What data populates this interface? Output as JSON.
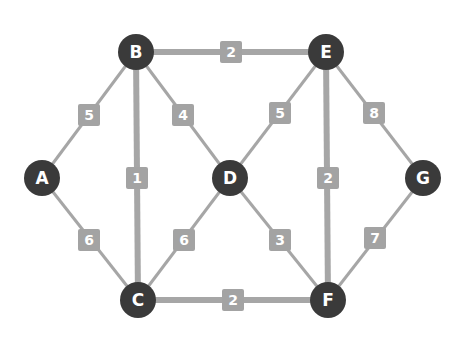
{
  "graph": {
    "colors": {
      "node": "#3a3a3a",
      "edge": "#a6a6a6",
      "label_bg": "#a3a3a3",
      "label_text": "#ffffff"
    },
    "nodes": [
      {
        "id": "A",
        "x": 42,
        "y": 178
      },
      {
        "id": "B",
        "x": 136,
        "y": 52
      },
      {
        "id": "C",
        "x": 138,
        "y": 300
      },
      {
        "id": "D",
        "x": 230,
        "y": 178
      },
      {
        "id": "E",
        "x": 326,
        "y": 52
      },
      {
        "id": "F",
        "x": 328,
        "y": 300
      },
      {
        "id": "G",
        "x": 423,
        "y": 178
      }
    ],
    "edges": [
      {
        "from": "A",
        "to": "B",
        "weight": "5",
        "lx": 89,
        "ly": 115,
        "thick": false
      },
      {
        "from": "A",
        "to": "C",
        "weight": "6",
        "lx": 89,
        "ly": 240,
        "thick": false
      },
      {
        "from": "B",
        "to": "E",
        "weight": "2",
        "lx": 231,
        "ly": 52,
        "thick": true
      },
      {
        "from": "B",
        "to": "C",
        "weight": "1",
        "lx": 137,
        "ly": 178,
        "thick": true
      },
      {
        "from": "B",
        "to": "D",
        "weight": "4",
        "lx": 183,
        "ly": 115,
        "thick": false
      },
      {
        "from": "C",
        "to": "D",
        "weight": "6",
        "lx": 184,
        "ly": 240,
        "thick": false
      },
      {
        "from": "C",
        "to": "F",
        "weight": "2",
        "lx": 233,
        "ly": 300,
        "thick": true
      },
      {
        "from": "D",
        "to": "E",
        "weight": "5",
        "lx": 280,
        "ly": 113,
        "thick": false
      },
      {
        "from": "D",
        "to": "F",
        "weight": "3",
        "lx": 280,
        "ly": 240,
        "thick": false
      },
      {
        "from": "E",
        "to": "F",
        "weight": "2",
        "lx": 328,
        "ly": 178,
        "thick": true
      },
      {
        "from": "E",
        "to": "G",
        "weight": "8",
        "lx": 374,
        "ly": 113,
        "thick": false
      },
      {
        "from": "F",
        "to": "G",
        "weight": "7",
        "lx": 375,
        "ly": 238,
        "thick": false
      }
    ]
  }
}
